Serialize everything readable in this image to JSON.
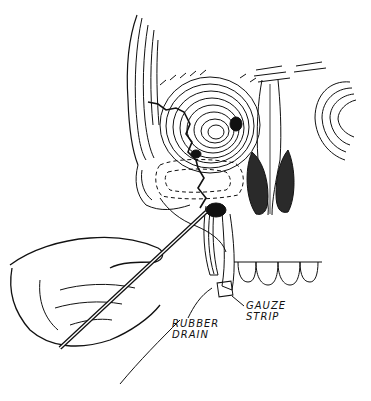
{
  "figure": {
    "labels": {
      "rubber_drain": [
        "RUBBER",
        "DRAIN"
      ],
      "gauze_strip": [
        "GAUZE",
        "STRIP"
      ]
    },
    "colors": {
      "ink": "#111111",
      "background": "#ffffff",
      "dark_fill": "#2a2a2a"
    }
  }
}
